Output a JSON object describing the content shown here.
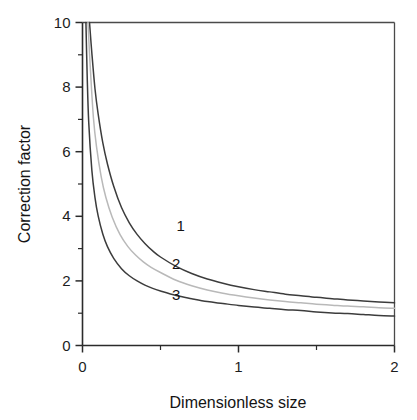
{
  "chart_data": {
    "type": "line",
    "title": "",
    "xlabel": "Dimensionless size",
    "ylabel": "Correction factor",
    "xlim": [
      0,
      2
    ],
    "ylim": [
      0,
      10
    ],
    "grid": false,
    "legend_position": "inline-labels",
    "x_ticks_major": [
      0,
      1,
      2
    ],
    "x_ticklabels": [
      "0",
      "1",
      "2"
    ],
    "x_ticks_minor": [
      0.5,
      1.5
    ],
    "y_ticks_major": [
      0,
      2,
      4,
      6,
      8,
      10
    ],
    "y_ticklabels": [
      "0",
      "2",
      "4",
      "6",
      "8",
      "10"
    ],
    "y_ticks_minor": [
      1,
      3,
      5,
      7,
      9
    ],
    "series": [
      {
        "name": "1",
        "label": "1",
        "color": "#3c3c3c",
        "label_x": 0.63,
        "label_y": 3.55,
        "x": [
          0.045,
          0.06,
          0.08,
          0.1,
          0.13,
          0.16,
          0.2,
          0.25,
          0.3,
          0.35,
          0.4,
          0.45,
          0.5,
          0.6,
          0.7,
          0.8,
          0.9,
          1.0,
          1.1,
          1.2,
          1.3,
          1.4,
          1.5,
          1.6,
          1.7,
          1.8,
          1.9,
          2.0
        ],
        "y": [
          10.0,
          9.05,
          7.95,
          7.18,
          6.28,
          5.62,
          4.93,
          4.27,
          3.8,
          3.44,
          3.16,
          2.93,
          2.74,
          2.45,
          2.23,
          2.06,
          1.93,
          1.82,
          1.73,
          1.66,
          1.59,
          1.54,
          1.49,
          1.45,
          1.41,
          1.38,
          1.35,
          1.32
        ]
      },
      {
        "name": "2",
        "label": "2",
        "color": "#b9b9b9",
        "label_x": 0.6,
        "label_y": 2.38,
        "x": [
          0.035,
          0.05,
          0.07,
          0.09,
          0.12,
          0.15,
          0.19,
          0.24,
          0.29,
          0.34,
          0.39,
          0.44,
          0.5,
          0.6,
          0.7,
          0.8,
          0.9,
          1.0,
          1.1,
          1.2,
          1.3,
          1.4,
          1.5,
          1.6,
          1.7,
          1.8,
          1.9,
          2.0
        ],
        "y": [
          10.0,
          8.6,
          7.05,
          6.15,
          5.22,
          4.58,
          3.98,
          3.44,
          3.07,
          2.8,
          2.59,
          2.42,
          2.26,
          2.02,
          1.85,
          1.72,
          1.62,
          1.54,
          1.47,
          1.41,
          1.36,
          1.32,
          1.28,
          1.25,
          1.22,
          1.2,
          1.17,
          1.15
        ]
      },
      {
        "name": "3",
        "label": "3",
        "color": "#3c3c3c",
        "label_x": 0.6,
        "label_y": 1.4,
        "x": [
          0.022,
          0.03,
          0.04,
          0.06,
          0.08,
          0.1,
          0.13,
          0.16,
          0.2,
          0.25,
          0.3,
          0.35,
          0.4,
          0.45,
          0.5,
          0.6,
          0.7,
          0.8,
          0.9,
          1.0,
          1.1,
          1.2,
          1.3,
          1.4,
          1.5,
          1.6,
          1.7,
          1.8,
          1.9,
          2.0
        ],
        "y": [
          10.0,
          8.35,
          6.9,
          5.42,
          4.58,
          4.02,
          3.45,
          3.06,
          2.7,
          2.38,
          2.16,
          2.0,
          1.87,
          1.77,
          1.69,
          1.55,
          1.45,
          1.36,
          1.3,
          1.24,
          1.19,
          1.15,
          1.11,
          1.08,
          1.04,
          1.01,
          0.99,
          0.96,
          0.93,
          0.91
        ]
      }
    ]
  },
  "colors": {
    "axis": "#2b2b2b",
    "frame": "#4a4a4a",
    "background": "#ffffff",
    "text": "#141414"
  }
}
